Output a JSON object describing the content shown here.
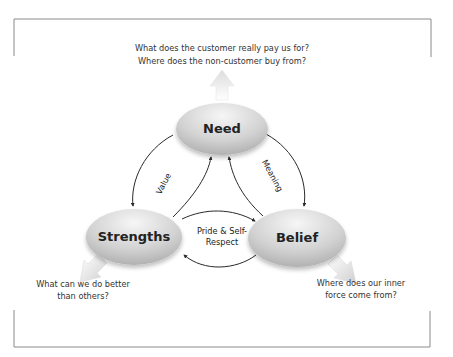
{
  "diagram": {
    "type": "cycle-triangle",
    "colors": {
      "frame": "#8a8a8a",
      "ellipse_light": "#f4f4f4",
      "ellipse_dark": "#a9a9a9",
      "arrow_stroke": "#2a2a2a",
      "block_arrow": "#e6e6e6",
      "text": "#333333"
    },
    "nodes": {
      "need": {
        "label": "Need"
      },
      "strengths": {
        "label": "Strengths"
      },
      "belief": {
        "label": "Belief"
      }
    },
    "edges": {
      "value": {
        "label": "Value",
        "from": "Need",
        "to": "Strengths"
      },
      "meaning": {
        "label": "Meaning",
        "from": "Need",
        "to": "Belief"
      },
      "pride": {
        "label_line1": "Pride & Self-",
        "label_line2": "Respect",
        "between": [
          "Strengths",
          "Belief"
        ]
      }
    },
    "questions": {
      "need": {
        "line1": "What does the customer really pay us for?",
        "line2": "Where does the non-customer buy from?"
      },
      "strengths": {
        "line1": "What can we do better",
        "line2": "than others?"
      },
      "belief": {
        "line1": "Where does our inner",
        "line2": "force come from?"
      }
    }
  }
}
